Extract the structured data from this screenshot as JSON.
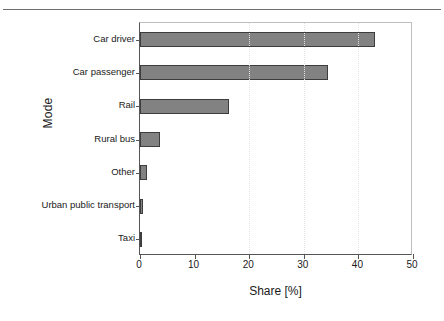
{
  "figure": {
    "has_top_rule": true,
    "background_color": "#ffffff"
  },
  "chart_data": {
    "type": "bar",
    "orientation": "horizontal",
    "title": "",
    "xlabel": "Share [%]",
    "ylabel": "Mode",
    "categories": [
      "Car driver",
      "Car passenger",
      "Rail",
      "Rural bus",
      "Other",
      "Urban public transport",
      "Taxi"
    ],
    "values": [
      43.0,
      34.4,
      16.3,
      3.7,
      1.3,
      0.5,
      0.25
    ],
    "xlim": [
      0,
      50
    ],
    "xticks": [
      0,
      10,
      20,
      30,
      40,
      50
    ],
    "xtick_labels": [
      "0",
      "10",
      "20",
      "30",
      "40",
      "50"
    ],
    "gridlines": [
      20,
      30,
      40
    ],
    "grid": true,
    "legend": null,
    "bar_fill_color": "#828282",
    "bar_edge_color": "#3d3d3d",
    "axis_color": "#555555"
  }
}
